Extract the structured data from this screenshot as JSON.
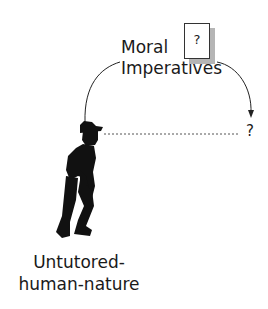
{
  "diagram": {
    "top_label_line1": "Moral",
    "top_label_line2": "Imperatives",
    "card_symbol": "?",
    "target_symbol": "?",
    "bottom_label_line1": "Untutored-",
    "bottom_label_line2": "human-nature",
    "figure": "silhouette-person-hat-hunched",
    "colors": {
      "ink": "#1a1a1a",
      "card_shadow": "#b5b5b5",
      "background": "#ffffff"
    }
  }
}
